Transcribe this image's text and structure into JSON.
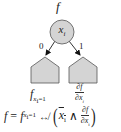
{
  "diagram": {
    "root_function_label": "f",
    "node": {
      "variable": "x",
      "index": "i",
      "fill_color": "#d4d4d4",
      "stroke_color": "#555555"
    },
    "edges": [
      {
        "label": "0",
        "from": "node",
        "to": "left-subtree"
      },
      {
        "label": "1",
        "from": "node",
        "to": "right-subtree"
      }
    ],
    "subtrees": [
      {
        "id": "left-subtree",
        "shape": "pentagon",
        "fill_color": "#d4d4d4"
      },
      {
        "id": "right-subtree",
        "shape": "pentagon",
        "fill_color": "#d4d4d4"
      }
    ],
    "subtree_labels": {
      "left": {
        "base": "f",
        "subscript_var": "x",
        "subscript_index": "i",
        "subscript_eq": "=1"
      },
      "right": {
        "numerator": "∂f",
        "denominator_var": "∂x",
        "denominator_index": "i"
      }
    },
    "formula": {
      "lhs": "f",
      "equals": "=",
      "rhs_base": "f",
      "rhs_sub_var": "x",
      "rhs_sub_index": "i",
      "rhs_sub_eq": "=1",
      "operator": "↮",
      "open_paren": "(",
      "negated_var": "x",
      "negated_index": "i",
      "and": "∧",
      "frac_num": "∂f",
      "frac_den_var": "∂x",
      "frac_den_index": "i",
      "close_paren": ")"
    }
  }
}
